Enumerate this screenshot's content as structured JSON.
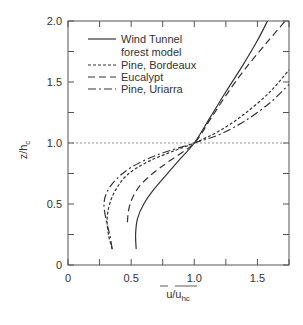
{
  "chart_data": {
    "type": "line",
    "title": "",
    "xlabel": "u/u_hc",
    "xlabel_main": "u/u",
    "xlabel_sub": "hc",
    "ylabel": "z/h_c",
    "ylabel_main": "z/h",
    "ylabel_sub": "c",
    "xlim": [
      0,
      1.75
    ],
    "ylim": [
      0,
      2.0
    ],
    "x_ticks": [
      "0",
      "0.5",
      "1.0",
      "1.5"
    ],
    "y_ticks": [
      "0",
      "0.5",
      "1.0",
      "1.5",
      "2.0"
    ],
    "reference_line": {
      "y": 1.0,
      "style": "dotted"
    },
    "legend_position": "upper left",
    "series": [
      {
        "name": "Wind Tunnel forest model",
        "legend_line1": "Wind Tunnel",
        "legend_line2": "forest model",
        "style": "solid",
        "points": [
          [
            0.54,
            0.13
          ],
          [
            0.535,
            0.25
          ],
          [
            0.55,
            0.38
          ],
          [
            0.6,
            0.5
          ],
          [
            0.68,
            0.62
          ],
          [
            0.78,
            0.74
          ],
          [
            0.88,
            0.86
          ],
          [
            1.0,
            1.0
          ],
          [
            1.12,
            1.2
          ],
          [
            1.25,
            1.42
          ],
          [
            1.38,
            1.63
          ],
          [
            1.5,
            1.84
          ],
          [
            1.58,
            2.0
          ]
        ]
      },
      {
        "name": "Pine, Bordeaux",
        "style": "short-dash",
        "points": [
          [
            0.35,
            0.13
          ],
          [
            0.32,
            0.25
          ],
          [
            0.31,
            0.38
          ],
          [
            0.33,
            0.5
          ],
          [
            0.38,
            0.62
          ],
          [
            0.47,
            0.74
          ],
          [
            0.62,
            0.84
          ],
          [
            0.8,
            0.92
          ],
          [
            1.0,
            1.0
          ],
          [
            1.2,
            1.1
          ],
          [
            1.4,
            1.24
          ],
          [
            1.6,
            1.42
          ],
          [
            1.75,
            1.6
          ]
        ]
      },
      {
        "name": "Eucalypt",
        "style": "long-dash",
        "points": [
          [
            0.47,
            0.35
          ],
          [
            0.48,
            0.45
          ],
          [
            0.51,
            0.55
          ],
          [
            0.57,
            0.65
          ],
          [
            0.67,
            0.75
          ],
          [
            0.8,
            0.85
          ],
          [
            1.0,
            1.0
          ],
          [
            1.13,
            1.2
          ],
          [
            1.27,
            1.42
          ],
          [
            1.42,
            1.63
          ],
          [
            1.58,
            1.83
          ],
          [
            1.72,
            2.0
          ]
        ]
      },
      {
        "name": "Pine, Uriarra",
        "style": "dash-dot",
        "points": [
          [
            0.35,
            0.13
          ],
          [
            0.33,
            0.25
          ],
          [
            0.3,
            0.38
          ],
          [
            0.285,
            0.5
          ],
          [
            0.31,
            0.6
          ],
          [
            0.38,
            0.7
          ],
          [
            0.5,
            0.8
          ],
          [
            0.7,
            0.9
          ],
          [
            1.0,
            1.0
          ],
          [
            1.2,
            1.07
          ],
          [
            1.4,
            1.18
          ],
          [
            1.6,
            1.33
          ],
          [
            1.75,
            1.48
          ]
        ]
      }
    ]
  }
}
